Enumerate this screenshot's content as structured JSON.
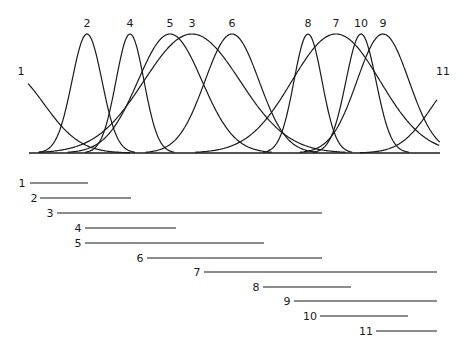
{
  "chart_data": {
    "type": "line",
    "title": "",
    "xlabel": "",
    "ylabel": "",
    "grid": false,
    "baseline": {
      "x1": 29,
      "x2": 440,
      "y": 153
    },
    "curves": [
      {
        "label": "1",
        "shape": "tail-left",
        "label_x": 21,
        "label_y": 75
      },
      {
        "label": "2",
        "peak_x": 87,
        "width": 15,
        "label_x": 87,
        "label_y": 27
      },
      {
        "label": "4",
        "peak_x": 130,
        "width": 14,
        "label_x": 130,
        "label_y": 27
      },
      {
        "label": "5",
        "peak_x": 170,
        "width": 32,
        "label_x": 170,
        "label_y": 27
      },
      {
        "label": "3",
        "peak_x": 192,
        "width": 48,
        "label_x": 192,
        "label_y": 27
      },
      {
        "label": "6",
        "peak_x": 232,
        "width": 27,
        "label_x": 232,
        "label_y": 27
      },
      {
        "label": "8",
        "peak_x": 308,
        "width": 14,
        "label_x": 308,
        "label_y": 27
      },
      {
        "label": "7",
        "peak_x": 336,
        "width": 44,
        "label_x": 336,
        "label_y": 27
      },
      {
        "label": "10",
        "peak_x": 361,
        "width": 15,
        "label_x": 361,
        "label_y": 27
      },
      {
        "label": "9",
        "peak_x": 383,
        "width": 26,
        "label_x": 383,
        "label_y": 27
      },
      {
        "label": "11",
        "shape": "tail-right",
        "label_x": 443,
        "label_y": 75
      }
    ],
    "ranges": [
      {
        "label": "1",
        "label_x": 22,
        "x1": 30,
        "x2": 88,
        "y": 183
      },
      {
        "label": "2",
        "label_x": 34,
        "x1": 40,
        "x2": 131,
        "y": 198
      },
      {
        "label": "3",
        "label_x": 50,
        "x1": 57,
        "x2": 322,
        "y": 213
      },
      {
        "label": "4",
        "label_x": 78,
        "x1": 85,
        "x2": 176,
        "y": 228
      },
      {
        "label": "5",
        "label_x": 78,
        "x1": 85,
        "x2": 264,
        "y": 243
      },
      {
        "label": "6",
        "label_x": 140,
        "x1": 147,
        "x2": 322,
        "y": 258
      },
      {
        "label": "7",
        "label_x": 197,
        "x1": 204,
        "x2": 437,
        "y": 272
      },
      {
        "label": "8",
        "label_x": 256,
        "x1": 263,
        "x2": 351,
        "y": 287
      },
      {
        "label": "9",
        "label_x": 287,
        "x1": 294,
        "x2": 437,
        "y": 301
      },
      {
        "label": "10",
        "label_x": 310,
        "x1": 320,
        "x2": 408,
        "y": 316
      },
      {
        "label": "11",
        "label_x": 366,
        "x1": 376,
        "x2": 437,
        "y": 331
      }
    ]
  }
}
